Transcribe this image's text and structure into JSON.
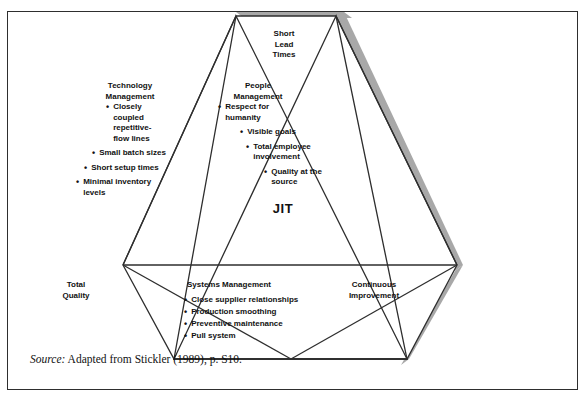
{
  "caption": {
    "text": "EXHIBIT 10.1    THE INTERSECTING ELEMENTS OF JIT"
  },
  "figure": {
    "center_label": "JIT",
    "top_vertex_label": {
      "lines": [
        "Short",
        "Lead",
        "Times"
      ],
      "full": "Short Lead Times"
    },
    "sections": [
      {
        "id": "technology-management",
        "heading": "Technology",
        "heading_line2": "Management",
        "bullets": [
          "Closely coupled repetitive-flow lines",
          "Small batch sizes",
          "Short setup times",
          "Minimal inventory levels"
        ],
        "bullet_lines": [
          [
            "Closely",
            "coupled",
            "repetitive-",
            "flow lines"
          ],
          [
            "Small batch sizes"
          ],
          [
            "Short setup times"
          ],
          [
            "Minimal inventory",
            "levels"
          ]
        ]
      },
      {
        "id": "people-management",
        "heading": "People",
        "heading_line2": "Management",
        "bullets": [
          "Respect for humanity",
          "Visible goals",
          "Total employee involvement",
          "Quality at the source"
        ],
        "bullet_lines": [
          [
            "Respect for",
            "humanity"
          ],
          [
            "Visible goals"
          ],
          [
            "Total employee",
            "involvement"
          ],
          [
            "Quality at the",
            "source"
          ]
        ]
      },
      {
        "id": "systems-management",
        "heading": "Systems Management",
        "heading_line2": "",
        "bullets": [
          "Close supplier relationships",
          "Production smoothing",
          "Preventive maintenance",
          "Pull system"
        ]
      }
    ],
    "corner_labels": {
      "bottom_left": {
        "line1": "Total",
        "line2": "Quality",
        "full": "Total Quality"
      },
      "bottom_right": {
        "line1": "Continuous",
        "line2": "Improvement",
        "full": "Continuous Improvement"
      }
    },
    "bullet_glyph": "•"
  },
  "source": {
    "label": "Source:",
    "text": " Adapted from Stickler (1989), p. S10."
  },
  "colors": {
    "line": "#2e2e2e",
    "shadow": "#a8a8a8",
    "text": "#111111",
    "background": "#ffffff",
    "frame": "#2e2e2e"
  }
}
